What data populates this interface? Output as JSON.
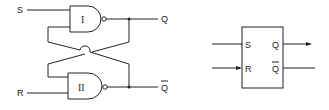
{
  "circuit": {
    "title": "SR latch using NAND gates",
    "inputs": {
      "s": "S",
      "r": "R"
    },
    "outputs": {
      "q": "Q",
      "q_bar": "Q"
    },
    "gates": [
      {
        "id": "gate-1",
        "label": "I",
        "type": "NAND"
      },
      {
        "id": "gate-2",
        "label": "II",
        "type": "NAND"
      }
    ]
  },
  "block": {
    "title": "SR flip-flop symbol",
    "pins": {
      "s": "S",
      "r": "R",
      "q": "Q",
      "q_bar": "Q"
    }
  },
  "colors": {
    "line": "#222222",
    "background": "#ffffff"
  }
}
